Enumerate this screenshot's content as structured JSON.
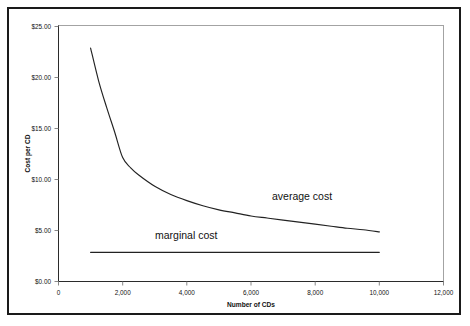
{
  "chart_data": {
    "type": "line",
    "title": "",
    "xlabel": "Number of CDs",
    "ylabel": "Cost per CD",
    "xlim": [
      0,
      12000
    ],
    "ylim": [
      0,
      25
    ],
    "grid": false,
    "legend_position": "inline-annotations",
    "x_ticks": [
      0,
      2000,
      4000,
      6000,
      8000,
      10000,
      12000
    ],
    "x_tick_labels": [
      "0",
      "2,000",
      "4,000",
      "6,000",
      "8,000",
      "10,000",
      "12,000"
    ],
    "y_ticks": [
      0,
      5,
      10,
      15,
      20,
      25
    ],
    "y_tick_labels": [
      "$0.00",
      "$5.00",
      "$10.00",
      "$15.00",
      "$20.00",
      "$25.00"
    ],
    "series": [
      {
        "name": "average cost",
        "annotation": "average cost",
        "x": [
          1000,
          1250,
          1500,
          1750,
          2000,
          2250,
          2500,
          3000,
          3500,
          4000,
          4500,
          5000,
          5500,
          6000,
          6500,
          7000,
          7500,
          8000,
          8500,
          9000,
          9500,
          10000
        ],
        "values": [
          22.8,
          19.6,
          17.0,
          14.6,
          12.1,
          11.1,
          10.4,
          9.3,
          8.5,
          7.9,
          7.4,
          7.0,
          6.7,
          6.4,
          6.2,
          6.0,
          5.8,
          5.6,
          5.4,
          5.2,
          5.05,
          4.85
        ]
      },
      {
        "name": "marginal cost",
        "annotation": "marginal cost",
        "x": [
          1000,
          10000
        ],
        "values": [
          2.85,
          2.85
        ]
      }
    ]
  },
  "annotations": {
    "average_cost": "average cost",
    "marginal_cost": "marginal cost"
  },
  "colors": {
    "curve": "#222222",
    "axis": "#2b2b2b",
    "frame": "#1a1a1a",
    "background": "#ffffff"
  }
}
